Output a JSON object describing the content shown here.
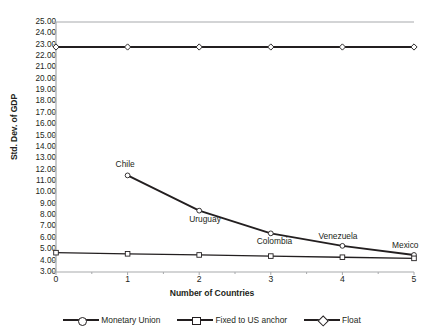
{
  "chart_data": {
    "type": "line",
    "title": "",
    "xlabel": "Number of Countries",
    "ylabel": "Std. Dev. of GDP",
    "x": [
      0,
      1,
      2,
      3,
      4,
      5
    ],
    "xlim": [
      0,
      5
    ],
    "ylim": [
      3.0,
      25.0
    ],
    "grid": false,
    "legend_position": "bottom",
    "x_tick_labels": [
      "0",
      "1",
      "2",
      "3",
      "4",
      "5"
    ],
    "y_tick_labels": [
      "25.00",
      "24.00",
      "23.00",
      "22.00",
      "21.00",
      "20.00",
      "19.00",
      "18.00",
      "17.00",
      "16.00",
      "15.00",
      "14.00",
      "13.00",
      "12.00",
      "11.00",
      "10.00",
      "9.00",
      "8.00",
      "7.00",
      "6.00",
      "5.00",
      "4.00",
      "3.00"
    ],
    "y_tick_values": [
      25.0,
      24.0,
      23.0,
      22.0,
      21.0,
      20.0,
      19.0,
      18.0,
      17.0,
      16.0,
      15.0,
      14.0,
      13.0,
      12.0,
      11.0,
      10.0,
      9.0,
      8.0,
      7.0,
      6.0,
      5.0,
      4.0,
      3.0
    ],
    "series": [
      {
        "name": "Monetary Union",
        "marker": "circle",
        "x": [
          1,
          2,
          3,
          4,
          5
        ],
        "values": [
          11.5,
          8.4,
          6.4,
          5.3,
          4.5
        ]
      },
      {
        "name": "Fixed to US anchor",
        "marker": "square",
        "x": [
          0,
          1,
          2,
          3,
          4,
          5
        ],
        "values": [
          4.7,
          4.6,
          4.5,
          4.4,
          4.3,
          4.2
        ]
      },
      {
        "name": "Float",
        "marker": "diamond",
        "x": [
          0,
          1,
          2,
          3,
          4,
          5
        ],
        "values": [
          22.8,
          22.8,
          22.8,
          22.8,
          22.8,
          22.8
        ]
      }
    ],
    "annotations": [
      {
        "text": "Chile",
        "x": 1,
        "y": 11.5
      },
      {
        "text": "Uruguay",
        "x": 2,
        "y": 8.4
      },
      {
        "text": "Colombia",
        "x": 3,
        "y": 6.4
      },
      {
        "text": "Venezuela",
        "x": 4,
        "y": 5.3
      },
      {
        "text": "Mexico",
        "x": 5,
        "y": 4.5
      }
    ],
    "colors": {
      "line": "#231f20",
      "axis": "#a7a9ac",
      "marker_fill": "#ffffff",
      "background": "#ffffff"
    }
  },
  "legend": {
    "items": [
      {
        "label": "Monetary Union",
        "marker": "circle"
      },
      {
        "label": "Fixed to US anchor",
        "marker": "square"
      },
      {
        "label": "Float",
        "marker": "diamond"
      }
    ]
  },
  "axes": {
    "y_title": "Std. Dev. of GDP",
    "x_title": "Number of Countries"
  }
}
